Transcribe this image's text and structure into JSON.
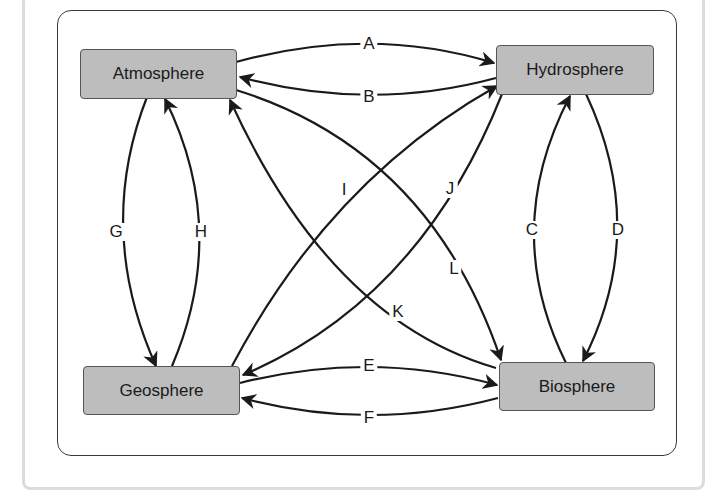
{
  "diagram": {
    "nodes": [
      {
        "id": "atmosphere",
        "label": "Atmosphere"
      },
      {
        "id": "hydrosphere",
        "label": "Hydrosphere"
      },
      {
        "id": "geosphere",
        "label": "Geosphere"
      },
      {
        "id": "biosphere",
        "label": "Biosphere"
      }
    ],
    "edges": [
      {
        "label": "A",
        "from": "Atmosphere",
        "to": "Hydrosphere"
      },
      {
        "label": "B",
        "from": "Hydrosphere",
        "to": "Atmosphere"
      },
      {
        "label": "C",
        "from": "Biosphere",
        "to": "Hydrosphere"
      },
      {
        "label": "D",
        "from": "Hydrosphere",
        "to": "Biosphere"
      },
      {
        "label": "E",
        "from": "Geosphere",
        "to": "Biosphere"
      },
      {
        "label": "F",
        "from": "Biosphere",
        "to": "Geosphere"
      },
      {
        "label": "G",
        "from": "Atmosphere",
        "to": "Geosphere"
      },
      {
        "label": "H",
        "from": "Geosphere",
        "to": "Atmosphere"
      },
      {
        "label": "I",
        "from": "Geosphere",
        "to": "Hydrosphere"
      },
      {
        "label": "J",
        "from": "Hydrosphere",
        "to": "Geosphere"
      },
      {
        "label": "K",
        "from": "Biosphere",
        "to": "Atmosphere"
      },
      {
        "label": "L",
        "from": "Atmosphere",
        "to": "Biosphere"
      }
    ],
    "colors": {
      "node_fill": "#bdbdbd",
      "line": "#1a1a1a",
      "frame": "#3a3a3a"
    }
  }
}
